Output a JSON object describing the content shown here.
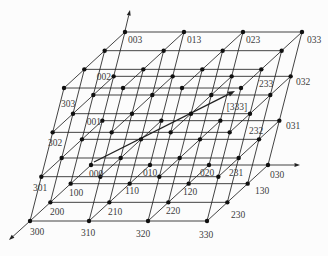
{
  "figure": {
    "type": "3d-lattice-diagram",
    "background": "#fcfcfc",
    "edge_color": "#222222",
    "node_color": "#101010",
    "label_color": "#3c3c3c",
    "lattice": {
      "n": 4,
      "origin": [
        91,
        165
      ],
      "step_x": [
        59,
        0
      ],
      "step_y": [
        -20.33,
        18.67
      ],
      "step_z": [
        11.33,
        -44.33
      ],
      "node_radius": 2.2,
      "edge_width": 0.85
    },
    "axes": [
      {
        "name": "z-axis-arrow",
        "from": [
          125,
          31
        ],
        "to": [
          130,
          10
        ]
      },
      {
        "name": "x-axis-arrow",
        "from": [
          268,
          165
        ],
        "to": [
          300,
          165
        ]
      },
      {
        "name": "y-axis-arrow",
        "from": [
          30,
          221
        ],
        "to": [
          9,
          240
        ]
      }
    ],
    "route_arrow": {
      "name": "route-arrow-000-to-333",
      "from": [
        94,
        162
      ],
      "to": [
        235,
        91
      ],
      "width": 1.3
    },
    "node_labels": [
      {
        "text": "003",
        "x": 128,
        "y": 43,
        "anchor": "start"
      },
      {
        "text": "013",
        "x": 187,
        "y": 43,
        "anchor": "start"
      },
      {
        "text": "023",
        "x": 246,
        "y": 43,
        "anchor": "start"
      },
      {
        "text": "033",
        "x": 307,
        "y": 43,
        "anchor": "start"
      },
      {
        "text": "032",
        "x": 296,
        "y": 85,
        "anchor": "start"
      },
      {
        "text": "031",
        "x": 286,
        "y": 129,
        "anchor": "start"
      },
      {
        "text": "030",
        "x": 270,
        "y": 178,
        "anchor": "start"
      },
      {
        "text": "002",
        "x": 111,
        "y": 80,
        "anchor": "end"
      },
      {
        "text": "001",
        "x": 101,
        "y": 125,
        "anchor": "end"
      },
      {
        "text": "000",
        "x": 96,
        "y": 177,
        "anchor": "middle"
      },
      {
        "text": "010",
        "x": 150,
        "y": 176,
        "anchor": "middle"
      },
      {
        "text": "020",
        "x": 207,
        "y": 176,
        "anchor": "middle"
      },
      {
        "text": "231",
        "x": 236,
        "y": 176,
        "anchor": "middle"
      },
      {
        "text": "232",
        "x": 256,
        "y": 134,
        "anchor": "middle"
      },
      {
        "text": "233",
        "x": 266,
        "y": 87,
        "anchor": "middle"
      },
      {
        "text": "[333]",
        "x": 237,
        "y": 110,
        "anchor": "middle"
      },
      {
        "text": "303",
        "x": 68,
        "y": 107,
        "anchor": "middle"
      },
      {
        "text": "302",
        "x": 55,
        "y": 146,
        "anchor": "middle"
      },
      {
        "text": "301",
        "x": 40,
        "y": 191,
        "anchor": "middle"
      },
      {
        "text": "300",
        "x": 37,
        "y": 235,
        "anchor": "middle"
      },
      {
        "text": "310",
        "x": 88,
        "y": 236,
        "anchor": "middle"
      },
      {
        "text": "320",
        "x": 143,
        "y": 237,
        "anchor": "middle"
      },
      {
        "text": "330",
        "x": 206,
        "y": 238,
        "anchor": "middle"
      },
      {
        "text": "100",
        "x": 76,
        "y": 196,
        "anchor": "middle"
      },
      {
        "text": "110",
        "x": 132,
        "y": 194,
        "anchor": "middle"
      },
      {
        "text": "120",
        "x": 190,
        "y": 195,
        "anchor": "middle"
      },
      {
        "text": "130",
        "x": 262,
        "y": 194,
        "anchor": "middle"
      },
      {
        "text": "200",
        "x": 57,
        "y": 215,
        "anchor": "middle"
      },
      {
        "text": "210",
        "x": 115,
        "y": 215,
        "anchor": "middle"
      },
      {
        "text": "220",
        "x": 173,
        "y": 214,
        "anchor": "middle"
      },
      {
        "text": "230",
        "x": 238,
        "y": 218,
        "anchor": "middle"
      }
    ]
  }
}
